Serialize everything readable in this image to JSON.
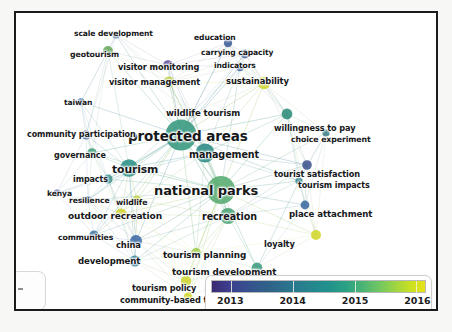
{
  "figure": {
    "type": "network-map",
    "background_color": "#ffffff",
    "frame_color": "#1b1b1b"
  },
  "legend": {
    "name": "publication-year-colorbar",
    "colormap": "viridis",
    "min": 2013,
    "max": 2016,
    "ticks": [
      {
        "label": "2013",
        "value": 2013,
        "pos_pct": 9
      },
      {
        "label": "2014",
        "value": 2014,
        "pos_pct": 38
      },
      {
        "label": "2015",
        "value": 2015,
        "pos_pct": 67
      },
      {
        "label": "2016",
        "value": 2016,
        "pos_pct": 96
      }
    ],
    "gradient_stops": [
      "#3b2a70",
      "#3d3f8f",
      "#36508e",
      "#2f6388",
      "#2a768e",
      "#25858e",
      "#21908d",
      "#2aa184",
      "#4cb574",
      "#73c760",
      "#a5d63f",
      "#cde11e",
      "#e8e21a"
    ]
  },
  "chart_data": {
    "type": "scatter",
    "subtype": "network-graph",
    "xlabel": "",
    "ylabel": "",
    "colorbar": {
      "label": "average publication year",
      "min": 2013,
      "max": 2016,
      "colormap": "viridis"
    },
    "nodes": [
      {
        "label": "scale development",
        "x": 100,
        "y": 22,
        "r": 3.6,
        "color": "#44709e",
        "font": 7.6,
        "lx": 58,
        "ly": 16,
        "year": 2013.5
      },
      {
        "label": "education",
        "x": 212,
        "y": 30,
        "r": 4.2,
        "color": "#3e5f96",
        "font": 7.6,
        "lx": 178,
        "ly": 20,
        "year": 2013.4
      },
      {
        "label": "geotourism",
        "x": 92,
        "y": 38,
        "r": 5.0,
        "color": "#6aa95f",
        "font": 7.8,
        "lx": 54,
        "ly": 37,
        "year": 2015.1
      },
      {
        "label": "carrying capacity",
        "x": 229,
        "y": 41,
        "r": 4.4,
        "color": "#3f5e95",
        "font": 7.6,
        "lx": 185,
        "ly": 35,
        "year": 2013.4
      },
      {
        "label": "visitor monitoring",
        "x": 152,
        "y": 52,
        "r": 4.8,
        "color": "#5b4d9c",
        "font": 8.2,
        "lx": 102,
        "ly": 49,
        "year": 2013.2
      },
      {
        "label": "indicators",
        "x": 224,
        "y": 54,
        "r": 4.2,
        "color": "#3f63a0",
        "font": 7.6,
        "lx": 198,
        "ly": 48,
        "year": 2013.5
      },
      {
        "label": "visitor management",
        "x": 153,
        "y": 69,
        "r": 5.6,
        "color": "#b8c93a",
        "font": 8.2,
        "lx": 93,
        "ly": 64,
        "year": 2015.7
      },
      {
        "label": "sustainability",
        "x": 248,
        "y": 70,
        "r": 6.2,
        "color": "#cfd52c",
        "font": 8.4,
        "lx": 210,
        "ly": 63,
        "year": 2015.9
      },
      {
        "label": "taiwan",
        "x": 65,
        "y": 89,
        "r": 3.8,
        "color": "#3f6fa6",
        "font": 7.6,
        "lx": 48,
        "ly": 85,
        "year": 2013.6
      },
      {
        "label": "wildlife tourism",
        "x": 176,
        "y": 100,
        "r": 4.4,
        "color": "#4b8e84",
        "font": 8.6,
        "lx": 150,
        "ly": 95,
        "year": 2014.3
      },
      {
        "label": "willingness to pay",
        "x": 271,
        "y": 101,
        "r": 5.4,
        "color": "#2e8c78",
        "font": 8.2,
        "lx": 258,
        "ly": 110,
        "year": 2014.5
      },
      {
        "label": "choice experiment",
        "x": 310,
        "y": 120,
        "r": 3.6,
        "color": "#3c7f85",
        "font": 7.8,
        "lx": 275,
        "ly": 122,
        "year": 2014.3
      },
      {
        "label": "protected areas",
        "x": 165,
        "y": 122,
        "r": 15.5,
        "color": "#35977d",
        "font": 13.5,
        "lx": 112,
        "ly": 115,
        "year": 2014.7
      },
      {
        "label": "community participation",
        "x": 70,
        "y": 122,
        "r": 4.6,
        "color": "#3d5f9a",
        "font": 8.0,
        "lx": 11,
        "ly": 117,
        "year": 2013.4
      },
      {
        "label": "management",
        "x": 189,
        "y": 140,
        "r": 9.5,
        "color": "#2a8a85",
        "font": 9.6,
        "lx": 173,
        "ly": 136,
        "year": 2014.2
      },
      {
        "label": "governance",
        "x": 76,
        "y": 140,
        "r": 4.8,
        "color": "#46a07a",
        "font": 8.0,
        "lx": 38,
        "ly": 138,
        "year": 2014.9
      },
      {
        "label": "tourism",
        "x": 113,
        "y": 155,
        "r": 8.8,
        "color": "#2b8f86",
        "font": 10.8,
        "lx": 96,
        "ly": 150,
        "year": 2014.2
      },
      {
        "label": "tourist satisfaction",
        "x": 291,
        "y": 152,
        "r": 4.8,
        "color": "#3e558f",
        "font": 8.2,
        "lx": 258,
        "ly": 156,
        "year": 2013.3
      },
      {
        "label": "impacts",
        "x": 92,
        "y": 166,
        "r": 4.6,
        "color": "#3f8f8a",
        "font": 8.0,
        "lx": 57,
        "ly": 162,
        "year": 2014.1
      },
      {
        "label": "tourism impacts",
        "x": 283,
        "y": 168,
        "r": 3.6,
        "color": "#2d7f8c",
        "font": 8.0,
        "lx": 282,
        "ly": 168,
        "year": 2014.0
      },
      {
        "label": "national parks",
        "x": 205,
        "y": 177,
        "r": 14.0,
        "color": "#56ab6e",
        "font": 13.0,
        "lx": 138,
        "ly": 170,
        "year": 2015.0
      },
      {
        "label": "kenya",
        "x": 41,
        "y": 180,
        "r": 3.4,
        "color": "#42559a",
        "font": 7.6,
        "lx": 31,
        "ly": 176,
        "year": 2013.2
      },
      {
        "label": "resilience",
        "x": 72,
        "y": 187,
        "r": 3.8,
        "color": "#3d6ea4",
        "font": 7.6,
        "lx": 53,
        "ly": 183,
        "year": 2013.6
      },
      {
        "label": "wildlife",
        "x": 121,
        "y": 187,
        "r": 4.4,
        "color": "#c6d234",
        "font": 7.8,
        "lx": 100,
        "ly": 185,
        "year": 2015.8
      },
      {
        "label": "place attachment",
        "x": 289,
        "y": 192,
        "r": 4.4,
        "color": "#3a6ba1",
        "font": 8.6,
        "lx": 273,
        "ly": 196,
        "year": 2013.7
      },
      {
        "label": "recreation",
        "x": 212,
        "y": 203,
        "r": 8.0,
        "color": "#48a274",
        "font": 9.6,
        "lx": 186,
        "ly": 198,
        "year": 2014.9
      },
      {
        "label": "outdoor recreation",
        "x": 105,
        "y": 201,
        "r": 5.6,
        "color": "#cfd42d",
        "font": 9.0,
        "lx": 52,
        "ly": 198,
        "year": 2015.9
      },
      {
        "label": "communities",
        "x": 78,
        "y": 222,
        "r": 4.6,
        "color": "#3f79a6",
        "font": 7.8,
        "lx": 42,
        "ly": 220,
        "year": 2013.8
      },
      {
        "label": "china",
        "x": 120,
        "y": 228,
        "r": 6.0,
        "color": "#3d6ba3",
        "font": 8.4,
        "lx": 100,
        "ly": 227,
        "year": 2013.7
      },
      {
        "label": "loyalty",
        "x": 300,
        "y": 222,
        "r": 5.0,
        "color": "#d2d62b",
        "font": 8.2,
        "lx": 248,
        "ly": 226,
        "year": 2015.9
      },
      {
        "label": "development",
        "x": 119,
        "y": 248,
        "r": 5.6,
        "color": "#2f7e96",
        "font": 8.6,
        "lx": 62,
        "ly": 243,
        "year": 2014.0
      },
      {
        "label": "tourism planning",
        "x": 180,
        "y": 240,
        "r": 5.0,
        "color": "#9dcd4a",
        "font": 8.8,
        "lx": 147,
        "ly": 237,
        "year": 2015.6
      },
      {
        "label": "tourism development",
        "x": 241,
        "y": 255,
        "r": 5.4,
        "color": "#3e9a81",
        "font": 8.8,
        "lx": 156,
        "ly": 254,
        "year": 2014.7
      },
      {
        "label": "tourism policy",
        "x": 170,
        "y": 268,
        "r": 5.2,
        "color": "#cdd430",
        "font": 8.2,
        "lx": 116,
        "ly": 270,
        "year": 2015.9
      },
      {
        "label": "community-based tourism",
        "x": 172,
        "y": 284,
        "r": 4.4,
        "color": "#d3d62b",
        "font": 8.2,
        "lx": 104,
        "ly": 282,
        "year": 2016.0
      }
    ],
    "node_count": 35,
    "edge_count": 180
  }
}
